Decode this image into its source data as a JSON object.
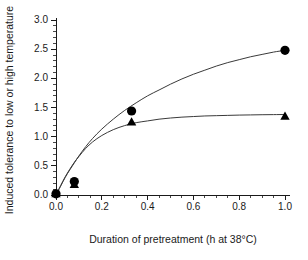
{
  "chart_data": {
    "type": "scatter",
    "title": "",
    "xlabel": "Duration of pretreatment (h at 38°C)",
    "ylabel": "Induced tolerance to low or high temperature",
    "xlim": [
      0.0,
      1.0
    ],
    "ylim": [
      0.0,
      3.0
    ],
    "xticks": [
      "0.0",
      "0.2",
      "0.4",
      "0.6",
      "0.8",
      "1.0"
    ],
    "xtick_values": [
      0.0,
      0.2,
      0.4,
      0.6,
      0.8,
      1.0
    ],
    "yticks": [
      "0.0",
      "0.5",
      "1.0",
      "1.5",
      "2.0",
      "2.5",
      "3.0"
    ],
    "ytick_values": [
      0.0,
      0.5,
      1.0,
      1.5,
      2.0,
      2.5,
      3.0
    ],
    "x_minor_step": 0.05,
    "y_minor_step": 0.1,
    "grid": false,
    "legend": "none",
    "series": [
      {
        "name": "circles",
        "marker": "filled-circle",
        "color": "#000000",
        "x": [
          0.0,
          0.08,
          0.33,
          1.0
        ],
        "values": [
          0.02,
          0.23,
          1.44,
          2.48
        ],
        "fit_curve": {
          "description": "saturating rise through circle points",
          "points": [
            [
              0.0,
              0.0
            ],
            [
              0.02,
              0.15
            ],
            [
              0.04,
              0.3
            ],
            [
              0.06,
              0.43
            ],
            [
              0.08,
              0.55
            ],
            [
              0.1,
              0.67
            ],
            [
              0.13,
              0.83
            ],
            [
              0.16,
              0.97
            ],
            [
              0.2,
              1.13
            ],
            [
              0.25,
              1.3
            ],
            [
              0.3,
              1.45
            ],
            [
              0.35,
              1.58
            ],
            [
              0.4,
              1.7
            ],
            [
              0.45,
              1.8
            ],
            [
              0.5,
              1.9
            ],
            [
              0.55,
              1.99
            ],
            [
              0.6,
              2.07
            ],
            [
              0.65,
              2.14
            ],
            [
              0.7,
              2.21
            ],
            [
              0.75,
              2.27
            ],
            [
              0.8,
              2.32
            ],
            [
              0.85,
              2.37
            ],
            [
              0.9,
              2.41
            ],
            [
              0.95,
              2.45
            ],
            [
              1.0,
              2.48
            ]
          ]
        }
      },
      {
        "name": "triangles",
        "marker": "filled-triangle",
        "color": "#000000",
        "x": [
          0.0,
          0.08,
          0.33,
          1.0
        ],
        "values": [
          0.02,
          0.18,
          1.25,
          1.35
        ],
        "fit_curve": {
          "description": "saturating rise plateauing near 1.38",
          "points": [
            [
              0.0,
              0.0
            ],
            [
              0.02,
              0.16
            ],
            [
              0.04,
              0.31
            ],
            [
              0.06,
              0.44
            ],
            [
              0.08,
              0.56
            ],
            [
              0.1,
              0.66
            ],
            [
              0.13,
              0.8
            ],
            [
              0.16,
              0.91
            ],
            [
              0.2,
              1.02
            ],
            [
              0.25,
              1.12
            ],
            [
              0.3,
              1.19
            ],
            [
              0.35,
              1.24
            ],
            [
              0.4,
              1.27
            ],
            [
              0.45,
              1.3
            ],
            [
              0.5,
              1.32
            ],
            [
              0.55,
              1.335
            ],
            [
              0.6,
              1.345
            ],
            [
              0.65,
              1.355
            ],
            [
              0.7,
              1.36
            ],
            [
              0.75,
              1.365
            ],
            [
              0.8,
              1.37
            ],
            [
              0.85,
              1.373
            ],
            [
              0.9,
              1.376
            ],
            [
              0.95,
              1.378
            ],
            [
              1.0,
              1.38
            ]
          ]
        }
      }
    ]
  }
}
